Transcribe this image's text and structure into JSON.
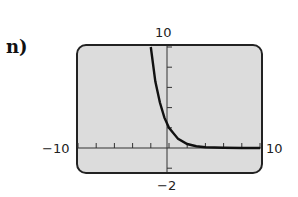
{
  "part_label": "n)",
  "chart_data": {
    "type": "line",
    "title": "",
    "xlabel": "",
    "ylabel": "",
    "xlim": [
      -10,
      10
    ],
    "ylim": [
      -2,
      10
    ],
    "xscale_ticks": 1,
    "yscale_ticks": 2,
    "window_labels": {
      "xmin": "−10",
      "xmax": "10",
      "ymin": "−2",
      "ymax": "10"
    },
    "series": [
      {
        "name": "f(x)",
        "description": "decreasing exponential, y-intercept about 2, approaches 0 as x increases",
        "x": [
          -2,
          -1.5,
          -1,
          -0.5,
          0,
          1,
          2,
          3,
          4,
          6,
          8,
          10
        ],
        "y": [
          10,
          6.6,
          4.5,
          3.0,
          2,
          0.9,
          0.4,
          0.18,
          0.08,
          0.02,
          0.0,
          0.0
        ]
      }
    ],
    "grid": false,
    "colors": {
      "screen": "#dcdcdc",
      "curve": "#111111",
      "frame": "#222222"
    }
  }
}
